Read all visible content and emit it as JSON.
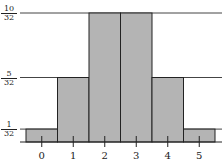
{
  "chart_data": {
    "type": "bar",
    "title": "",
    "xlabel": "",
    "ylabel": "",
    "categories": [
      "0",
      "1",
      "2",
      "3",
      "4",
      "5"
    ],
    "values": [
      0.03125,
      0.15625,
      0.3125,
      0.3125,
      0.15625,
      0.03125
    ],
    "values_as_fractions": [
      "1/32",
      "5/32",
      "10/32",
      "10/32",
      "5/32",
      "1/32"
    ],
    "ylim": [
      0,
      0.3125
    ],
    "y_ticks": [
      {
        "label_num": "1",
        "label_den": "32",
        "value": 0.03125
      },
      {
        "label_num": "5",
        "label_den": "32",
        "value": 0.15625
      },
      {
        "label_num": "10",
        "label_den": "32",
        "value": 0.3125
      }
    ],
    "grid": "horizontal reference lines at tick values",
    "bar_color": "#b4b4b4",
    "edge_color": "#222222"
  }
}
